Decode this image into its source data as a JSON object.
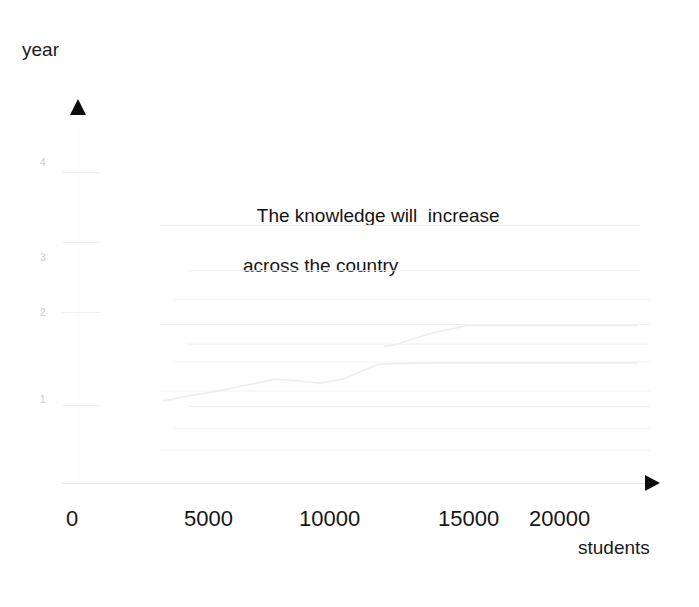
{
  "canvas": {
    "width": 699,
    "height": 607,
    "background": "#ffffff"
  },
  "axis_titles": {
    "y": "year",
    "x": "students"
  },
  "title": {
    "line1": "The knowledge will  increase",
    "line2": "across the country"
  },
  "icons": {
    "y_axis_arrow": "triangle-up-icon",
    "x_axis_arrow": "triangle-right-icon"
  },
  "colors": {
    "text": "#151515",
    "tick_label_faint": "#c9c9cf",
    "gridline": "#f2f2f5",
    "axis_line": "#e9e9ec",
    "series_line": "#eeeef1",
    "arrow": "#0d0d0d"
  },
  "chart_data": {
    "type": "line",
    "title": "The knowledge will  increase across the country",
    "xlabel": "students",
    "ylabel": "year",
    "xlim": [
      0,
      23500
    ],
    "ylim": [
      0,
      4.6
    ],
    "grid": true,
    "legend": "none",
    "xticks": [
      0,
      5000,
      10000,
      15000,
      20000
    ],
    "xtick_labels": [
      "0",
      "5000",
      "10000",
      "15000",
      "20000"
    ],
    "yticks": [
      1,
      2,
      3,
      4
    ],
    "ytick_labels": [
      "1",
      "2",
      "3",
      "4"
    ],
    "series": [
      {
        "name": "growth-curve",
        "color": "#eeeef1",
        "x": [
          3500,
          4600,
          5800,
          7000,
          8100,
          9000,
          9900,
          10900,
          11700,
          12300,
          12900,
          15500,
          19000,
          23000
        ],
        "y": [
          1.05,
          1.12,
          1.18,
          1.26,
          1.33,
          1.31,
          1.28,
          1.33,
          1.44,
          1.52,
          1.53,
          1.54,
          1.54,
          1.54
        ]
      },
      {
        "name": "step-segment",
        "color": "#eeeef1",
        "x": [
          12600,
          13000,
          14500,
          16000,
          23000
        ],
        "y": [
          1.75,
          1.77,
          1.92,
          2.02,
          2.02
        ]
      }
    ],
    "gridline_values": [
      0.42,
      0.7,
      0.98,
      1.18,
      1.55,
      1.78,
      2.03,
      2.35,
      2.72,
      3.3
    ]
  },
  "xticks_px": [
    {
      "label": "0",
      "left": 66
    },
    {
      "label": "5000",
      "left": 184
    },
    {
      "label": "10000",
      "left": 299
    },
    {
      "label": "15000",
      "left": 438
    },
    {
      "label": "20000",
      "left": 529
    }
  ],
  "yticks_px": [
    {
      "label": "4",
      "top": 158,
      "mark_top": 172
    },
    {
      "label": "3",
      "top": 253,
      "mark_top": 242
    },
    {
      "label": "2",
      "top": 308,
      "mark_top": 312
    },
    {
      "label": "1",
      "top": 395,
      "mark_top": 405
    }
  ]
}
